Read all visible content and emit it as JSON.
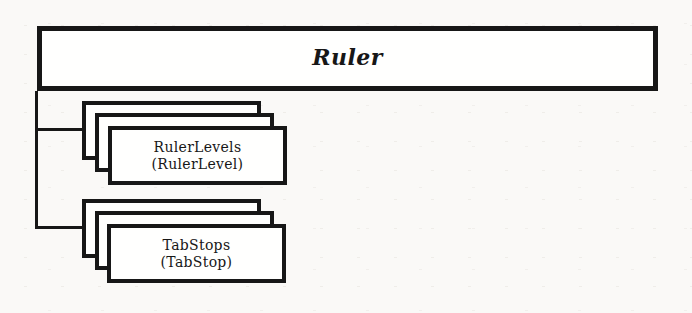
{
  "diagram": {
    "title": "Ruler",
    "stacks": [
      {
        "line1": "RulerLevels",
        "line2": "(RulerLevel)"
      },
      {
        "line1": "TabStops",
        "line2": "(TabStop)"
      }
    ]
  },
  "colors": {
    "ink": "#171717",
    "paper": "#faf9f7",
    "box_fill": "#fffffe"
  }
}
